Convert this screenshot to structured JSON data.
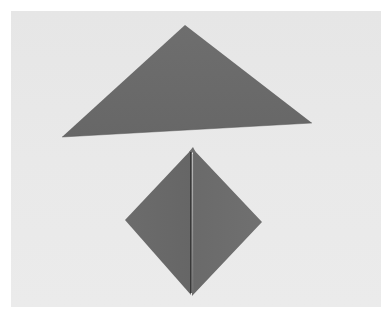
{
  "image": {
    "description": "Photo of two folded gray paper shapes showing origami folding steps",
    "background_color": "#e8e8e8",
    "paper_color": "#6b6b6b",
    "crease_color": "#2a2a2a"
  },
  "shapes": [
    {
      "name": "folded-triangle",
      "points": "185,25 312,123 62,137"
    },
    {
      "name": "folded-diamond",
      "points": "192,149 262,222 192,296 125,220",
      "crease": {
        "x1": 191,
        "y1": 152,
        "x2": 191,
        "y2": 293
      }
    }
  ]
}
